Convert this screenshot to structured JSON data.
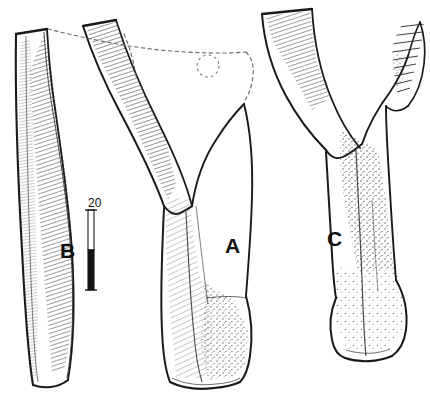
{
  "figure": {
    "background_color": "#ffffff",
    "ink_color": "#1a1a1a",
    "medium": "ink line drawing with hatching and stipple shading",
    "specimens": [
      {
        "id": "A",
        "label": "A",
        "position": "center",
        "description": "Y-shaped bone with two diverging proximal rami meeting in a V, broad shaft, expanded distal end; dashed reconstruction outline at upper right"
      },
      {
        "id": "B",
        "label": "B",
        "position": "left",
        "description": "Narrow elongate bone fragment with dense linear hatching along one margin, tapering distal end"
      },
      {
        "id": "C",
        "label": "C",
        "position": "right",
        "description": "Y-shaped bone with a short hatched/serrated process on the right ramus and an expanded distal end"
      }
    ],
    "scale_bar": {
      "label": "20",
      "orientation": "vertical",
      "style": "two-tone half white half black",
      "top_segment_color": "#ffffff",
      "bottom_segment_color": "#111111"
    },
    "annotations": {
      "dashed_lines": "dashed reconstruction outline across the top of specimen A",
      "dashed_circle": "small dashed circle between specimens B and A"
    }
  },
  "labels": {
    "a": "A",
    "b": "B",
    "c": "C",
    "scale_value": "20"
  }
}
